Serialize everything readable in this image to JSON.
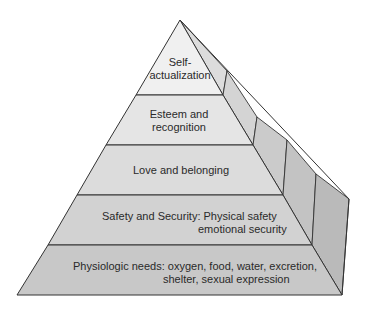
{
  "diagram": {
    "colors": {
      "outline": "#333333",
      "level1_fill": "#f0f0f0",
      "level2_fill": "#e4e4e4",
      "level3_fill": "#dadada",
      "level4_fill": "#d0d0d0",
      "level5_fill": "#c6c6c6",
      "side_fill_light": "#d8d8d8",
      "side_fill_dark": "#bcbcbc",
      "text": "#2a2a2a"
    },
    "levels": [
      {
        "name": "Self-actualization",
        "lines": [
          "Self-",
          "actualization"
        ]
      },
      {
        "name": "Esteem and recognition",
        "lines": [
          "Esteem and",
          "recognition"
        ]
      },
      {
        "name": "Love and belonging",
        "lines": [
          "Love and belonging"
        ]
      },
      {
        "name": "Safety and Security",
        "lines": [
          "Safety and Security: Physical safety",
          "emotional security"
        ]
      },
      {
        "name": "Physiologic needs",
        "lines": [
          "Physiologic needs: oxygen, food, water, excretion,",
          "shelter, sexual expression"
        ]
      }
    ]
  }
}
